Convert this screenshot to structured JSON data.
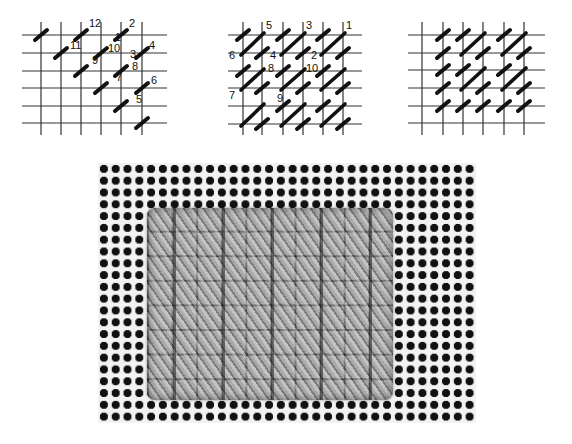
{
  "diagrams": [
    {
      "id": "diagram-1",
      "description": "Continental tent stitch worked in diagonal rows with numbered needle sequence",
      "grid": {
        "h_lines_y": [
          35,
          53,
          71,
          88,
          106,
          123
        ],
        "v_lines_x": [
          41,
          61,
          81,
          101,
          121,
          142
        ],
        "x_range": [
          22,
          167
        ],
        "y_range": [
          22,
          135
        ]
      },
      "stitches": [
        [
          41,
          35
        ],
        [
          81,
          35
        ],
        [
          121,
          35
        ],
        [
          61,
          53
        ],
        [
          101,
          53
        ],
        [
          142,
          53
        ],
        [
          81,
          71
        ],
        [
          121,
          71
        ],
        [
          101,
          88
        ],
        [
          142,
          88
        ],
        [
          121,
          106
        ],
        [
          142,
          123
        ]
      ],
      "labels": [
        {
          "text": "12",
          "x": 89,
          "y": 27
        },
        {
          "text": "2",
          "x": 129,
          "y": 27
        },
        {
          "text": "1",
          "x": 115,
          "y": 41
        },
        {
          "text": "11",
          "x": 70,
          "y": 49
        },
        {
          "text": "10",
          "x": 108,
          "y": 52
        },
        {
          "text": "4",
          "x": 149,
          "y": 49
        },
        {
          "text": "3",
          "x": 130,
          "y": 58
        },
        {
          "text": "9",
          "x": 92,
          "y": 64
        },
        {
          "text": "8",
          "x": 132,
          "y": 70
        },
        {
          "text": "7",
          "x": 116,
          "y": 81
        },
        {
          "text": "6",
          "x": 151,
          "y": 84
        },
        {
          "text": "5",
          "x": 136,
          "y": 103
        }
      ]
    },
    {
      "id": "diagram-2",
      "description": "Long and short diagonal stitch pattern with numbered sequence",
      "grid": {
        "h_lines_y": [
          35,
          53,
          71,
          88,
          106,
          124
        ],
        "v_lines_x": [
          243,
          262,
          283,
          303,
          323,
          343
        ],
        "x_range": [
          228,
          362
        ],
        "y_range": [
          22,
          135
        ]
      },
      "short_stitches": [
        [
          243,
          35
        ],
        [
          283,
          35
        ],
        [
          323,
          35
        ],
        [
          262,
          53
        ],
        [
          303,
          53
        ],
        [
          343,
          53
        ],
        [
          243,
          71
        ],
        [
          283,
          71
        ],
        [
          323,
          71
        ],
        [
          262,
          88
        ],
        [
          303,
          88
        ],
        [
          343,
          88
        ],
        [
          283,
          106
        ],
        [
          323,
          106
        ],
        [
          262,
          124
        ],
        [
          303,
          124
        ],
        [
          343,
          124
        ]
      ],
      "long_stitches": [
        [
          [
            243,
            53
          ],
          [
            262,
            35
          ]
        ],
        [
          [
            283,
            53
          ],
          [
            303,
            35
          ]
        ],
        [
          [
            323,
            53
          ],
          [
            343,
            35
          ]
        ],
        [
          [
            243,
            88
          ],
          [
            262,
            71
          ]
        ],
        [
          [
            283,
            88
          ],
          [
            303,
            71
          ]
        ],
        [
          [
            323,
            88
          ],
          [
            343,
            71
          ]
        ],
        [
          [
            243,
            124
          ],
          [
            262,
            106
          ]
        ],
        [
          [
            283,
            124
          ],
          [
            303,
            106
          ]
        ],
        [
          [
            323,
            124
          ],
          [
            343,
            106
          ]
        ]
      ],
      "labels": [
        {
          "text": "5",
          "x": 266,
          "y": 29
        },
        {
          "text": "3",
          "x": 306,
          "y": 29
        },
        {
          "text": "1",
          "x": 346,
          "y": 29
        },
        {
          "text": "6",
          "x": 229,
          "y": 59
        },
        {
          "text": "4",
          "x": 270,
          "y": 59
        },
        {
          "text": "2",
          "x": 311,
          "y": 59
        },
        {
          "text": "8",
          "x": 268,
          "y": 72
        },
        {
          "text": "10",
          "x": 306,
          "y": 72
        },
        {
          "text": "7",
          "x": 229,
          "y": 99
        },
        {
          "text": "9",
          "x": 277,
          "y": 102
        }
      ]
    },
    {
      "id": "diagram-3",
      "description": "Completed stitch pattern without numbering",
      "grid": {
        "h_lines_y": [
          35,
          53,
          70,
          88,
          106,
          123
        ],
        "v_lines_x": [
          422,
          443,
          463,
          483,
          504,
          524
        ],
        "x_range": [
          408,
          545
        ],
        "y_range": [
          22,
          135
        ]
      },
      "short_stitches": [
        [
          443,
          35
        ],
        [
          463,
          35
        ],
        [
          504,
          35
        ],
        [
          443,
          53
        ],
        [
          483,
          53
        ],
        [
          524,
          53
        ],
        [
          443,
          70
        ],
        [
          463,
          70
        ],
        [
          504,
          70
        ],
        [
          443,
          88
        ],
        [
          483,
          88
        ],
        [
          524,
          88
        ],
        [
          443,
          106
        ],
        [
          463,
          106
        ],
        [
          483,
          106
        ],
        [
          504,
          106
        ],
        [
          524,
          106
        ]
      ],
      "long_stitches": [
        [
          [
            463,
            53
          ],
          [
            483,
            35
          ]
        ],
        [
          [
            504,
            53
          ],
          [
            524,
            35
          ]
        ],
        [
          [
            463,
            88
          ],
          [
            483,
            70
          ]
        ],
        [
          [
            504,
            88
          ],
          [
            524,
            70
          ]
        ]
      ]
    }
  ],
  "photo": {
    "description": "Photograph of needlepoint canvas showing worked stitch sample",
    "mesh_color": "#f2f2f2",
    "hole_color": "#111111",
    "yarn_color": "#9a9a9a"
  }
}
